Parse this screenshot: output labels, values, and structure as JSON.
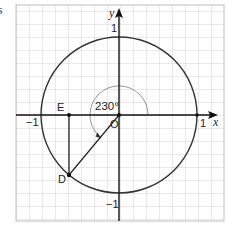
{
  "stray_text": "s",
  "diagram": {
    "type": "unit-circle",
    "angle_label": "230°",
    "angle_deg": 230,
    "axes": {
      "x_label": "x",
      "y_label": "y"
    },
    "ticks": {
      "x_pos": "1",
      "x_neg": "−1",
      "y_pos": "1",
      "y_neg": "−1"
    },
    "points": {
      "origin": "O",
      "D": "D",
      "E": "E"
    },
    "colors": {
      "grid": "#c8c8c8",
      "axis": "#111111",
      "circle": "#333333",
      "arc": "#888888"
    }
  }
}
